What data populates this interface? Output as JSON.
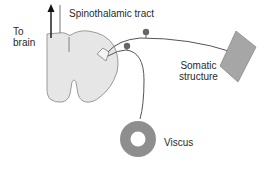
{
  "diagram": {
    "type": "anatomy-schematic",
    "colors": {
      "spinal_cord_fill": "#e6e6e6",
      "spinal_cord_stroke": "#9a9a9a",
      "nerve_line": "#555555",
      "ganglion_dot": "#666666",
      "somatic_fill": "#a6a6a6",
      "viscus_fill": "#8e8e8e",
      "arrow": "#111111"
    },
    "labels": {
      "to_brain": "To\nbrain",
      "spinothalamic_tract": "Spinothalamic tract",
      "somatic_structure": "Somatic\nstructure",
      "viscus": "Viscus"
    },
    "elements": [
      {
        "id": "spinal-cord",
        "shape": "cord-cross-section"
      },
      {
        "id": "dorsal-horn-neuron",
        "shape": "small-quadrilateral"
      },
      {
        "id": "ascending-arrow",
        "direction": "up"
      },
      {
        "id": "somatic-afferent",
        "from": "dorsal-horn",
        "to": "somatic-structure",
        "ganglion": true
      },
      {
        "id": "visceral-afferent",
        "from": "dorsal-horn",
        "to": "viscus",
        "ganglion": true
      },
      {
        "id": "somatic-structure",
        "shape": "diamond"
      },
      {
        "id": "viscus",
        "shape": "ring"
      }
    ]
  }
}
